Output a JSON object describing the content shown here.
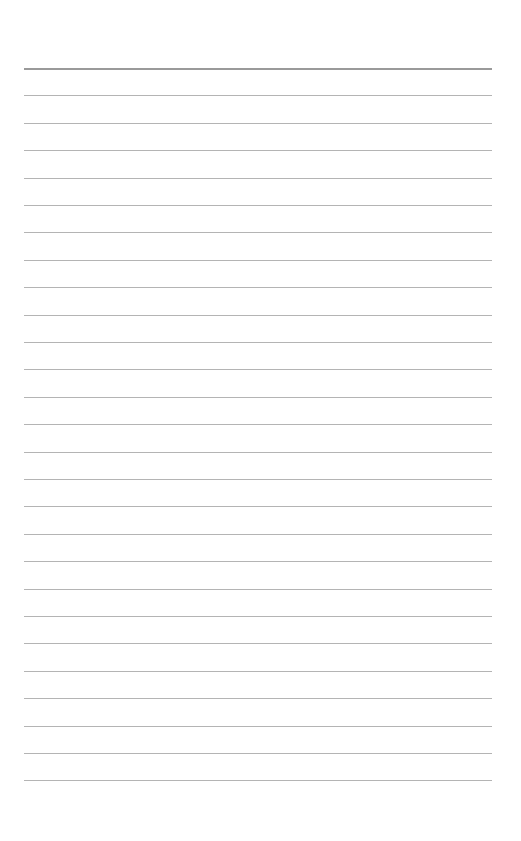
{
  "page": {
    "type": "lined-paper",
    "background_color": "#ffffff",
    "line_color": "#b4b4b4",
    "header_line_color": "#9a9a9a",
    "line_count": 27,
    "first_line_y": 68,
    "line_spacing": 27.4,
    "line_left_x": 24,
    "line_right_x": 492,
    "text_content": []
  }
}
